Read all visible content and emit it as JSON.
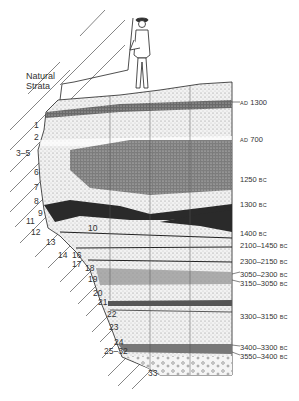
{
  "diagram": {
    "title_line1": "Natural",
    "title_line2": "Strata",
    "layer_labels": [
      {
        "text": "1",
        "x": 34,
        "y": 121
      },
      {
        "text": "2",
        "x": 34,
        "y": 133
      },
      {
        "text": "3–5",
        "x": 16,
        "y": 149
      },
      {
        "text": "6",
        "x": 34,
        "y": 168
      },
      {
        "text": "7",
        "x": 34,
        "y": 183
      },
      {
        "text": "8",
        "x": 34,
        "y": 197
      },
      {
        "text": "9",
        "x": 38,
        "y": 209
      },
      {
        "text": "11",
        "x": 26,
        "y": 217
      },
      {
        "text": "12",
        "x": 31,
        "y": 228
      },
      {
        "text": "10",
        "x": 88,
        "y": 224
      },
      {
        "text": "13",
        "x": 46,
        "y": 238
      },
      {
        "text": "14",
        "x": 58,
        "y": 251
      },
      {
        "text": "16",
        "x": 72,
        "y": 251
      },
      {
        "text": "17",
        "x": 72,
        "y": 260
      },
      {
        "text": "18",
        "x": 85,
        "y": 264
      },
      {
        "text": "19",
        "x": 88,
        "y": 275
      },
      {
        "text": "20",
        "x": 93,
        "y": 289
      },
      {
        "text": "21",
        "x": 98,
        "y": 298
      },
      {
        "text": "22",
        "x": 107,
        "y": 310
      },
      {
        "text": "23",
        "x": 109,
        "y": 323
      },
      {
        "text": "24",
        "x": 114,
        "y": 338
      },
      {
        "text": "25–32",
        "x": 104,
        "y": 347
      },
      {
        "text": "33",
        "x": 148,
        "y": 369
      }
    ],
    "date_labels": [
      {
        "value": "1300",
        "era": "AD",
        "era_first": true,
        "y": 99
      },
      {
        "value": "700",
        "era": "AD",
        "era_first": true,
        "y": 136
      },
      {
        "value": "1250",
        "era": "BC",
        "era_first": false,
        "y": 176
      },
      {
        "value": "1300",
        "era": "BC",
        "era_first": false,
        "y": 201
      },
      {
        "value": "1400",
        "era": "BC",
        "era_first": false,
        "y": 230
      },
      {
        "value": "2100–1450",
        "era": "BC",
        "era_first": false,
        "y": 242
      },
      {
        "value": "2300–2150",
        "era": "BC",
        "era_first": false,
        "y": 258
      },
      {
        "value": "3050–2300",
        "era": "BC",
        "era_first": false,
        "y": 271
      },
      {
        "value": "3150–3050",
        "era": "BC",
        "era_first": false,
        "y": 280
      },
      {
        "value": "3300–3150",
        "era": "BC",
        "era_first": false,
        "y": 313
      },
      {
        "value": "3400–3300",
        "era": "BC",
        "era_first": false,
        "y": 344
      },
      {
        "value": "3550–3400",
        "era": "BC",
        "era_first": false,
        "y": 353
      }
    ],
    "colors": {
      "ink": "#1a1a1a",
      "paper": "#ffffff",
      "light_fill": "#e6e6e6",
      "mid_fill": "#a8a8a8",
      "dark_fill": "#3a3a3a"
    }
  }
}
